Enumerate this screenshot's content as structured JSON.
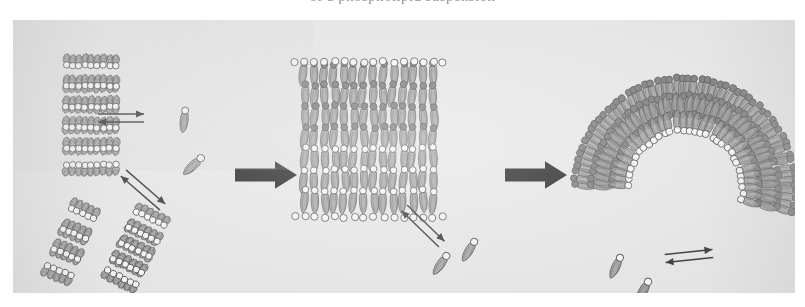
{
  "figure": {
    "caption_clipped_above": "of a phospholipid suspension",
    "background_color": "#e2e2e2",
    "border_color": "#cfcfcf",
    "panel_count": 3
  },
  "legend_colors": {
    "headgroup_light": "#f2f2f2",
    "headgroup_dark": "#6e6e6e",
    "tail_gray": "#8d8d8d",
    "outline": "#4a4a4a",
    "arrow_black": "#111111",
    "equilibrium_arrow": "#2b2b2b"
  },
  "stages": [
    {
      "id": "stage-1",
      "name": "lamellar-stacks-and-monomers",
      "label": "Lamellar stacks / bilayer fragments in equilibrium with free lipid monomers",
      "structures": [
        {
          "name": "multilamellar-stack",
          "type": "stack",
          "x": 78,
          "y": 95,
          "sheets": 5,
          "lipids_per_row": 9,
          "height": 104,
          "rotation": 0
        },
        {
          "name": "bilayer-fragment-left",
          "type": "fragment",
          "x": 58,
          "y": 222,
          "sheets": 3,
          "lipids_per_row": 5,
          "height": 66,
          "rotation": 22
        },
        {
          "name": "bilayer-fragment-right",
          "type": "fragment",
          "x": 123,
          "y": 228,
          "sheets": 4,
          "lipids_per_row": 6,
          "height": 70,
          "rotation": 26
        }
      ],
      "free_lipids": [
        {
          "name": "free-lipid-1",
          "x": 172,
          "y": 93,
          "rotation": 4,
          "scale": 1.0
        },
        {
          "name": "free-lipid-2",
          "x": 186,
          "y": 140,
          "rotation": 44,
          "scale": 1.05
        }
      ],
      "equilibrium_arrows": [
        {
          "name": "equilibrium-arrow-horizontal",
          "x": 108,
          "y": 98,
          "length": 46,
          "rotation": 0
        },
        {
          "name": "equilibrium-arrow-diagonal",
          "x": 130,
          "y": 170,
          "length": 52,
          "rotation": 41
        }
      ]
    },
    {
      "id": "stage-2",
      "name": "bilayer-disc-curving",
      "label": "Bilayer sheet / disc beginning to curve, still exchanging monomers",
      "structures": [
        {
          "name": "bilayer-disc",
          "type": "disc",
          "x": 356,
          "y": 120,
          "width": 138,
          "height": 148,
          "rows": 7,
          "columns": 14
        }
      ],
      "free_lipids": [
        {
          "name": "free-lipid-3",
          "x": 432,
          "y": 238,
          "rotation": 32,
          "scale": 1.0
        },
        {
          "name": "free-lipid-4",
          "x": 460,
          "y": 224,
          "rotation": 28,
          "scale": 1.0
        }
      ],
      "equilibrium_arrows": [
        {
          "name": "equilibrium-arrow-diagonal-2",
          "x": 410,
          "y": 206,
          "length": 52,
          "rotation": 44
        }
      ]
    },
    {
      "id": "stage-3",
      "name": "closed-vesicle-liposome",
      "label": "Closed curved vesicle (liposome) in equilibrium with free lipid monomers",
      "structures": [
        {
          "name": "vesicle-outer-leaflet",
          "type": "arc-bilayer",
          "cx": 672,
          "cy": 168,
          "radius_outer": 108,
          "radius_inner": 60,
          "arc_start_deg": 182,
          "arc_end_deg": 372,
          "heads": 58
        }
      ],
      "free_lipids": [
        {
          "name": "free-lipid-5",
          "x": 606,
          "y": 240,
          "rotation": 22,
          "scale": 1.0
        },
        {
          "name": "free-lipid-6",
          "x": 634,
          "y": 264,
          "rotation": 26,
          "scale": 1.05
        }
      ],
      "equilibrium_arrows": [
        {
          "name": "equilibrium-arrow-horizontal-2",
          "x": 676,
          "y": 236,
          "length": 48,
          "rotation": -6
        }
      ]
    }
  ],
  "transition_arrows": [
    {
      "name": "transition-arrow-1",
      "from": "stage-1",
      "to": "stage-2",
      "x": 222,
      "y": 155,
      "length": 62,
      "head": 22,
      "thickness": 13
    },
    {
      "name": "transition-arrow-2",
      "from": "stage-2",
      "to": "stage-3",
      "x": 492,
      "y": 155,
      "length": 62,
      "head": 22,
      "thickness": 13
    }
  ]
}
